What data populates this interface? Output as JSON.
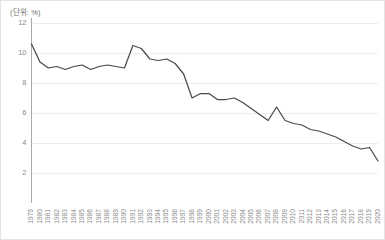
{
  "unit_label": "(단위: %)",
  "chart_data": {
    "type": "line",
    "title": "",
    "subtitle": "",
    "xlabel": "",
    "ylabel": "",
    "unit": "%",
    "unit_note": "(단위: %)",
    "grid": true,
    "grid_axis": "y",
    "legend": false,
    "legend_position": "none",
    "line_color": "#4a4a4a",
    "ylim": [
      0,
      12
    ],
    "yticks": [
      2,
      4,
      6,
      8,
      10,
      12
    ],
    "ytick_labels": [
      "2",
      "4",
      "6",
      "8",
      "10",
      "12"
    ],
    "xlim": [
      1979,
      2020
    ],
    "categories": [
      "1979",
      "1980",
      "1981",
      "1982",
      "1983",
      "1984",
      "1985",
      "1986",
      "1987",
      "1988",
      "1989",
      "1990",
      "1991",
      "1992",
      "1993",
      "1994",
      "1995",
      "1996",
      "1997",
      "1998",
      "1999",
      "2000",
      "2001",
      "2002",
      "2003",
      "2004",
      "2005",
      "2006",
      "2007",
      "2008",
      "2009",
      "2010",
      "2011",
      "2012",
      "2013",
      "2014",
      "2015",
      "2016",
      "2017",
      "2018",
      "2019",
      "2020"
    ],
    "values": [
      10.6,
      9.4,
      9.0,
      9.1,
      8.9,
      9.1,
      9.2,
      8.9,
      9.1,
      9.2,
      9.1,
      9.0,
      10.5,
      10.3,
      9.6,
      9.5,
      9.6,
      9.3,
      8.6,
      7.0,
      7.3,
      7.3,
      6.9,
      6.9,
      7.0,
      6.7,
      6.3,
      5.9,
      5.5,
      6.4,
      5.5,
      5.3,
      5.2,
      4.9,
      4.8,
      4.6,
      4.4,
      4.1,
      3.8,
      3.6,
      3.7,
      2.8
    ]
  }
}
